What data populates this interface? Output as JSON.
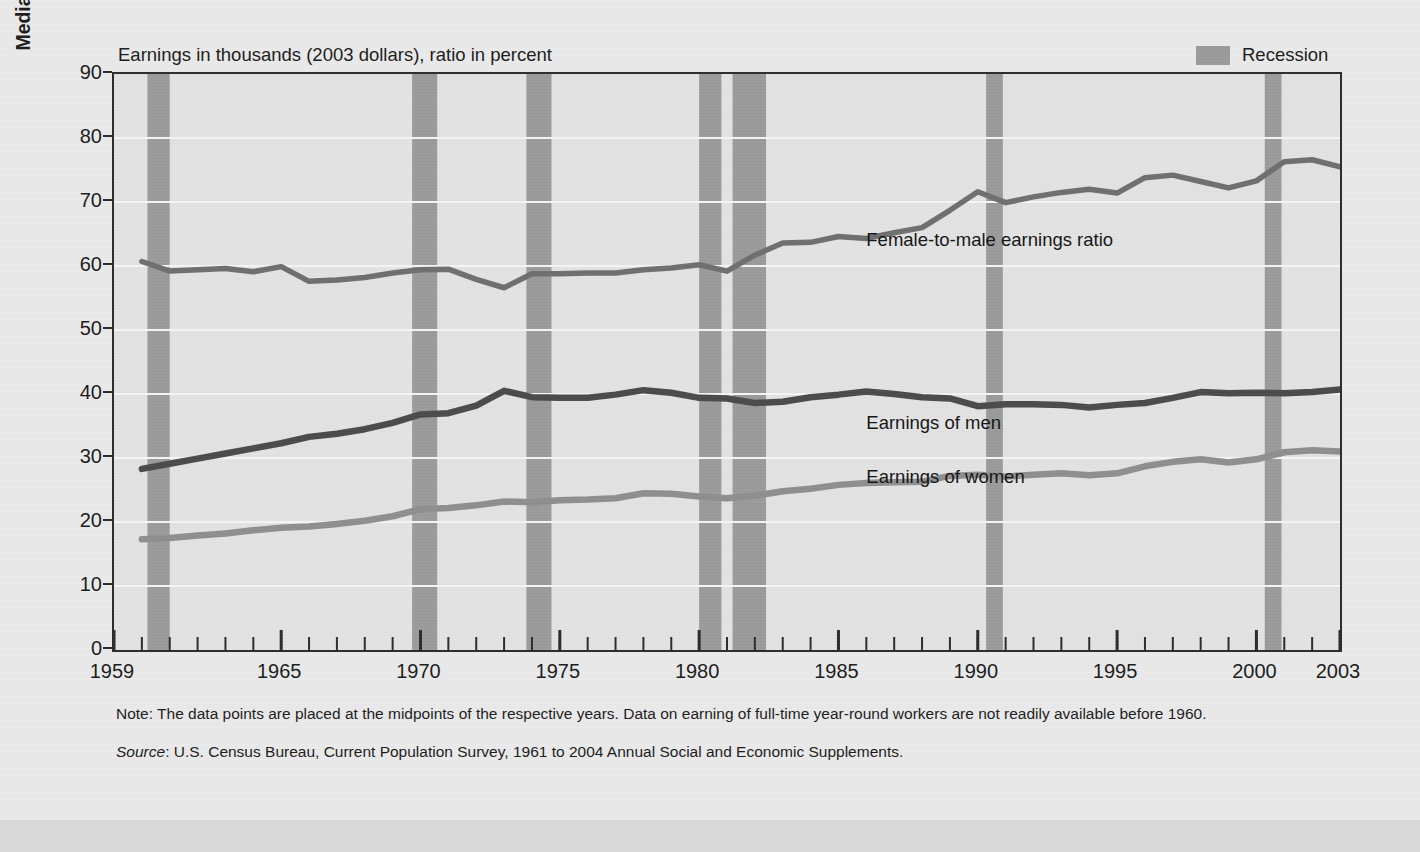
{
  "figure": {
    "plot_caption": "Earnings in thousands (2003 dollars), ratio in percent",
    "y_axis_title": "Median Annual Earnings, 1998 Dollars (thousands)",
    "legend_recession_label": "Recession",
    "note": "Note: The data points are placed at the midpoints of the respective years. Data on earning of full-time year-round workers are not readily available before 1960.",
    "source_label": "Source",
    "source_text": ": U.S. Census Bureau, Current Population Survey, 1961 to 2004 Annual Social and Economic Supplements.",
    "colors": {
      "recession_band": "#9a9a9a",
      "men_line": "#4a4a4a",
      "women_line": "#8e8e8e",
      "ratio_line": "#6e6e6e",
      "plot_background": "#e2e2e2",
      "figure_background": "#e9e9e9",
      "gridline": "#f4f4f4",
      "axis": "#2b2b2b"
    }
  },
  "chart_data": {
    "type": "line",
    "title": "Earnings in thousands (2003 dollars), ratio in percent",
    "xlabel": "",
    "ylabel": "Median Annual Earnings, 1998 Dollars (thousands)",
    "xlim": [
      1959,
      2003
    ],
    "ylim": [
      0,
      90
    ],
    "ytick_labels": [
      "0",
      "10",
      "20",
      "30",
      "40",
      "50",
      "60",
      "70",
      "80",
      "90"
    ],
    "yticks": [
      0,
      10,
      20,
      30,
      40,
      50,
      60,
      70,
      80,
      90
    ],
    "xtick_labels": [
      "1959",
      "1965",
      "1970",
      "1975",
      "1980",
      "1985",
      "1990",
      "1995",
      "2000",
      "2003"
    ],
    "xticks": [
      1959,
      1965,
      1970,
      1975,
      1980,
      1985,
      1990,
      1995,
      2000,
      2003
    ],
    "minor_xtick_interval": 1,
    "grid": "horizontal",
    "legend_position": "top-right",
    "x": [
      1960,
      1961,
      1962,
      1963,
      1964,
      1965,
      1966,
      1967,
      1968,
      1969,
      1970,
      1971,
      1972,
      1973,
      1974,
      1975,
      1976,
      1977,
      1978,
      1979,
      1980,
      1981,
      1982,
      1983,
      1984,
      1985,
      1986,
      1987,
      1988,
      1989,
      1990,
      1991,
      1992,
      1993,
      1994,
      1995,
      1996,
      1997,
      1998,
      1999,
      2000,
      2001,
      2002,
      2003
    ],
    "series": [
      {
        "name": "Female-to-male earnings ratio",
        "unit": "percent",
        "color": "#6e6e6e",
        "values": [
          60.7,
          59.2,
          59.4,
          59.6,
          59.1,
          59.9,
          57.6,
          57.8,
          58.2,
          58.9,
          59.4,
          59.5,
          57.9,
          56.6,
          58.8,
          58.8,
          58.9,
          58.9,
          59.4,
          59.7,
          60.2,
          59.2,
          61.7,
          63.6,
          63.7,
          64.6,
          64.3,
          65.2,
          66.0,
          68.7,
          71.6,
          69.9,
          70.8,
          71.5,
          72.0,
          71.4,
          73.8,
          74.2,
          73.2,
          72.2,
          73.3,
          76.3,
          76.6,
          75.5
        ]
      },
      {
        "name": "Earnings of men",
        "unit": "thousands of 2003 dollars",
        "color": "#4a4a4a",
        "values": [
          28.3,
          29.1,
          29.9,
          30.7,
          31.5,
          32.3,
          33.3,
          33.8,
          34.5,
          35.5,
          36.8,
          37.0,
          38.2,
          40.5,
          39.5,
          39.4,
          39.4,
          39.9,
          40.6,
          40.2,
          39.4,
          39.3,
          38.6,
          38.8,
          39.5,
          39.9,
          40.4,
          40.0,
          39.5,
          39.3,
          38.1,
          38.4,
          38.4,
          38.3,
          37.9,
          38.3,
          38.6,
          39.4,
          40.3,
          40.1,
          40.2,
          40.1,
          40.3,
          40.7
        ]
      },
      {
        "name": "Earnings of women",
        "unit": "thousands of 2003 dollars",
        "color": "#8e8e8e",
        "values": [
          17.3,
          17.5,
          17.9,
          18.2,
          18.7,
          19.1,
          19.3,
          19.7,
          20.2,
          20.9,
          22.0,
          22.2,
          22.6,
          23.2,
          23.1,
          23.4,
          23.5,
          23.7,
          24.5,
          24.4,
          24.0,
          23.7,
          24.1,
          24.8,
          25.2,
          25.8,
          26.1,
          26.2,
          26.3,
          27.2,
          27.4,
          27.1,
          27.4,
          27.6,
          27.3,
          27.6,
          28.7,
          29.4,
          29.8,
          29.3,
          29.8,
          30.9,
          31.2,
          31.0
        ]
      }
    ],
    "recession_bands": [
      {
        "start": 1960.2,
        "end": 1961.0
      },
      {
        "start": 1969.7,
        "end": 1970.6
      },
      {
        "start": 1973.8,
        "end": 1974.7
      },
      {
        "start": 1980.0,
        "end": 1980.8
      },
      {
        "start": 1981.2,
        "end": 1982.4
      },
      {
        "start": 1990.3,
        "end": 1990.9
      },
      {
        "start": 2000.3,
        "end": 2000.9
      }
    ],
    "annotations": [
      {
        "text": "Female-to-male earnings ratio",
        "x": 1986.0,
        "y": 64.0
      },
      {
        "text": "Earnings of men",
        "x": 1986.0,
        "y": 35.5
      },
      {
        "text": "Earnings of women",
        "x": 1986.0,
        "y": 27.0
      }
    ]
  }
}
